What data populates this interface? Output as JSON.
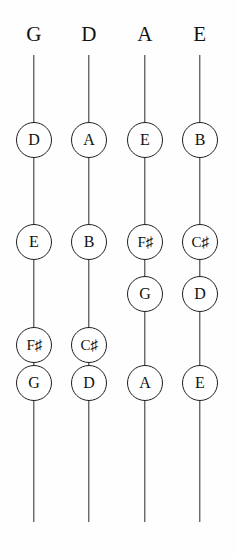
{
  "diagram": {
    "type": "string-note-chart",
    "background_color": "#fefefe",
    "line_color": "#2a2a2a",
    "text_color": "#111111",
    "string_count": 4,
    "strings": [
      {
        "name": "G",
        "header_label": "G",
        "center_x": 34,
        "line_top": 55,
        "line_bottom": 522,
        "notes": [
          {
            "label": "D",
            "y": 140,
            "accidental": false
          },
          {
            "label": "E",
            "y": 242,
            "accidental": false
          },
          {
            "label": "F♯",
            "letter": "F",
            "sharp": "♯",
            "y": 345,
            "accidental": true
          },
          {
            "label": "G",
            "y": 383,
            "accidental": false
          }
        ]
      },
      {
        "name": "D",
        "header_label": "D",
        "center_x": 89,
        "line_top": 55,
        "line_bottom": 522,
        "notes": [
          {
            "label": "A",
            "y": 140,
            "accidental": false
          },
          {
            "label": "B",
            "y": 242,
            "accidental": false
          },
          {
            "label": "C♯",
            "letter": "C",
            "sharp": "♯",
            "y": 345,
            "accidental": true
          },
          {
            "label": "D",
            "y": 383,
            "accidental": false
          }
        ]
      },
      {
        "name": "A",
        "header_label": "A",
        "center_x": 145,
        "line_top": 55,
        "line_bottom": 522,
        "notes": [
          {
            "label": "E",
            "y": 140,
            "accidental": false
          },
          {
            "label": "F♯",
            "letter": "F",
            "sharp": "♯",
            "y": 242,
            "accidental": true
          },
          {
            "label": "G",
            "y": 294,
            "accidental": false
          },
          {
            "label": "A",
            "y": 383,
            "accidental": false
          }
        ]
      },
      {
        "name": "E",
        "header_label": "E",
        "center_x": 200,
        "line_top": 55,
        "line_bottom": 522,
        "notes": [
          {
            "label": "B",
            "y": 140,
            "accidental": false
          },
          {
            "label": "C♯",
            "letter": "C",
            "sharp": "♯",
            "y": 242,
            "accidental": true
          },
          {
            "label": "D",
            "y": 294,
            "accidental": false
          },
          {
            "label": "E",
            "y": 383,
            "accidental": false
          }
        ]
      }
    ]
  }
}
